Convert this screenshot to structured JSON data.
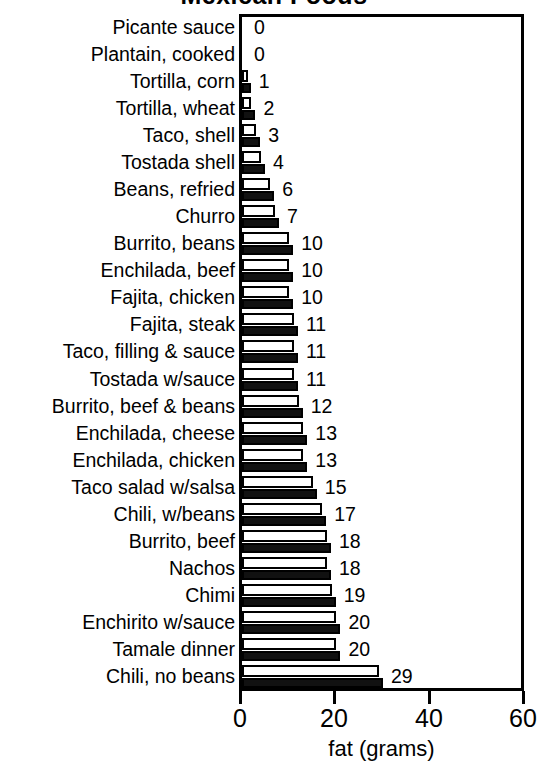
{
  "chart_data": {
    "type": "bar",
    "orientation": "horizontal",
    "title": "Mexican Foods",
    "xlabel": "fat (grams)",
    "ylabel": "",
    "xlim": [
      0,
      60
    ],
    "xticks": [
      0,
      20,
      40,
      60
    ],
    "grid": false,
    "legend": "none",
    "categories": [
      "Picante sauce",
      "Plantain, cooked",
      "Tortilla, corn",
      "Tortilla, wheat",
      "Taco, shell",
      "Tostada shell",
      "Beans, refried",
      "Churro",
      "Burrito, beans",
      "Enchilada, beef",
      "Fajita, chicken",
      "Fajita, steak",
      "Taco, filling & sauce",
      "Tostada w/sauce",
      "Burrito, beef & beans",
      "Enchilada, cheese",
      "Enchilada, chicken",
      "Taco salad w/salsa",
      "Chili, w/beans",
      "Burrito, beef",
      "Nachos",
      "Chimi",
      "Enchirito w/sauce",
      "Tamale dinner",
      "Chili, no beans"
    ],
    "values": [
      0,
      0,
      1,
      2,
      3,
      4,
      6,
      7,
      10,
      10,
      10,
      11,
      11,
      11,
      12,
      13,
      13,
      15,
      17,
      18,
      18,
      19,
      20,
      20,
      29
    ],
    "data_labels": [
      "0",
      "0",
      "1",
      "2",
      "3",
      "4",
      "6",
      "7",
      "10",
      "10",
      "10",
      "11",
      "11",
      "11",
      "12",
      "13",
      "13",
      "15",
      "17",
      "18",
      "18",
      "19",
      "20",
      "20",
      "29"
    ],
    "series": [
      {
        "name": "white-bar",
        "style": "hollow",
        "color": "#ffffff",
        "values": [
          0,
          0,
          1,
          2,
          3,
          4,
          6,
          7,
          10,
          10,
          10,
          11,
          11,
          11,
          12,
          13,
          13,
          15,
          17,
          18,
          18,
          19,
          20,
          20,
          29
        ]
      },
      {
        "name": "black-bar",
        "style": "filled",
        "color": "#111111",
        "values": [
          0,
          0,
          1,
          2,
          3,
          4,
          6,
          7,
          10,
          10,
          10,
          11,
          11,
          11,
          12,
          13,
          13,
          15,
          17,
          18,
          18,
          19,
          20,
          20,
          29
        ]
      }
    ]
  },
  "axis": {
    "tick_labels": [
      "0",
      "20",
      "40",
      "60"
    ],
    "title": "fat (grams)"
  },
  "colors": {
    "bar_fill_hollow": "#ffffff",
    "bar_fill_solid": "#111111",
    "outline": "#000000",
    "background": "#ffffff"
  }
}
